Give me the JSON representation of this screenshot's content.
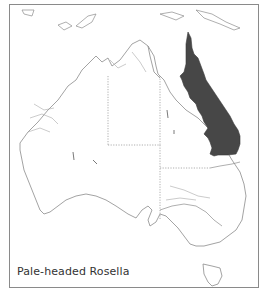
{
  "map": {
    "title": "Pale-headed Rosella",
    "region": "Australia",
    "colors": {
      "range_fill": "#474747",
      "coastline": "#8c8c8c",
      "state_border": "#9a9a9a",
      "frame": "#8a8a8a",
      "background": "#ffffff"
    },
    "legend": {
      "range_label": "Distribution range (shaded)"
    }
  }
}
